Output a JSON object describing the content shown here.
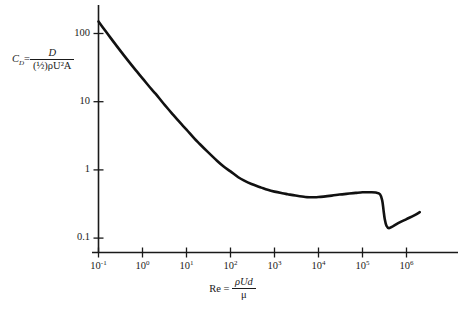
{
  "figure": {
    "background_color": "#ffffff",
    "curve_color": "#111111",
    "axis_color": "#1a1a1a"
  },
  "axes": {
    "y_title_lead": "C",
    "y_title_sub": "D",
    "y_title_eq": "=",
    "y_numerator": "D",
    "y_denominator": "(½)ρU²A",
    "x_title_lead": "Re",
    "x_title_eq": "=",
    "x_numerator": "ρUd",
    "x_denominator": "μ",
    "y_ticks": [
      {
        "label": "100",
        "value": 100
      },
      {
        "label": "10",
        "value": 10
      },
      {
        "label": "1",
        "value": 1
      },
      {
        "label": "0.1",
        "value": 0.1
      }
    ],
    "x_ticks": [
      {
        "mantissa": "10",
        "exponent": "-1",
        "value": 0.1
      },
      {
        "mantissa": "10",
        "exponent": "0",
        "value": 1
      },
      {
        "mantissa": "10",
        "exponent": "1",
        "value": 10
      },
      {
        "mantissa": "10",
        "exponent": "2",
        "value": 100
      },
      {
        "mantissa": "10",
        "exponent": "3",
        "value": 1000
      },
      {
        "mantissa": "10",
        "exponent": "4",
        "value": 10000
      },
      {
        "mantissa": "10",
        "exponent": "5",
        "value": 100000
      },
      {
        "mantissa": "10",
        "exponent": "6",
        "value": 1000000
      }
    ]
  },
  "caption": {
    "text": ""
  },
  "chart_data": {
    "type": "line",
    "title": "",
    "subtitle": "",
    "xlabel": "Re = ρUd / μ",
    "ylabel": "C_D = D / ((½)ρU²A)",
    "xscale": "log",
    "yscale": "log",
    "xlim": [
      0.1,
      2000000
    ],
    "ylim": [
      0.1,
      200
    ],
    "grid": false,
    "legend": null,
    "x_tick_values": [
      0.1,
      1,
      10,
      100,
      1000,
      10000,
      100000,
      1000000
    ],
    "x_tick_labels": [
      "10^-1",
      "10^0",
      "10^1",
      "10^2",
      "10^3",
      "10^4",
      "10^5",
      "10^6"
    ],
    "y_tick_values": [
      0.1,
      1,
      10,
      100
    ],
    "y_tick_labels": [
      "0.1",
      "1",
      "10",
      "100"
    ],
    "series": [
      {
        "name": "Sphere drag coefficient",
        "x": [
          0.1,
          0.15,
          0.2,
          0.3,
          0.5,
          0.7,
          1.0,
          1.5,
          2.0,
          3.0,
          5.0,
          7.0,
          10,
          15,
          20,
          30,
          50,
          70,
          100,
          150,
          200,
          300,
          500,
          700,
          1000,
          1500,
          2000,
          3000,
          5000,
          7000,
          10000,
          20000,
          30000,
          50000,
          70000,
          100000,
          150000,
          200000,
          250000,
          280000,
          300000,
          320000,
          350000,
          400000,
          500000,
          700000,
          1000000,
          1500000,
          2000000
        ],
        "y": [
          150,
          105,
          82,
          58,
          38,
          29,
          22,
          16,
          13,
          9.4,
          6.4,
          5.0,
          3.9,
          2.9,
          2.4,
          1.85,
          1.35,
          1.12,
          0.95,
          0.78,
          0.7,
          0.62,
          0.55,
          0.51,
          0.48,
          0.455,
          0.44,
          0.42,
          0.4,
          0.398,
          0.4,
          0.42,
          0.435,
          0.45,
          0.46,
          0.47,
          0.47,
          0.465,
          0.44,
          0.36,
          0.26,
          0.19,
          0.152,
          0.14,
          0.15,
          0.17,
          0.19,
          0.215,
          0.24
        ]
      }
    ],
    "annotations": [
      {
        "text": "drag crisis",
        "x": 300000,
        "y": 0.15,
        "shown": false
      }
    ]
  }
}
